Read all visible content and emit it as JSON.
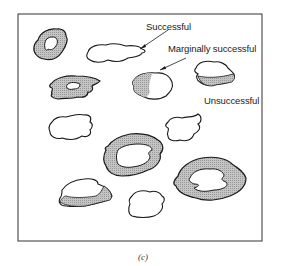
{
  "labels": {
    "successful": "Successful",
    "marginally_successful": "Marginally successful",
    "unsuccessful": "Unsuccessful"
  },
  "caption": "(c)",
  "colors": {
    "outline": "#1a1a1a",
    "halo_fill": "#b8b8b8",
    "background": "#ffffff"
  },
  "legend_semantics": {
    "successful": "plain outline, no shaded halo",
    "marginally_successful": "partial shaded rim",
    "unsuccessful": "thick shaded ring around island"
  }
}
